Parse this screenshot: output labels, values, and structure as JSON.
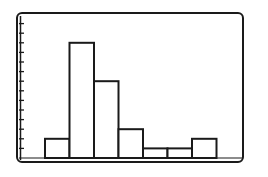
{
  "chart_data": {
    "type": "bar",
    "title": "",
    "xlabel": "",
    "ylabel": "",
    "categories": [
      "1",
      "2",
      "3",
      "4",
      "5",
      "6",
      "7"
    ],
    "values": [
      2,
      12,
      8,
      3,
      1,
      1,
      2
    ],
    "ylim": [
      0,
      14
    ],
    "y_tick_count": 14,
    "grid": false,
    "legend": null,
    "style": "histogram",
    "colors": {
      "stroke": "#1a1a1a",
      "fill": "#ffffff",
      "background": "#ffffff"
    }
  }
}
